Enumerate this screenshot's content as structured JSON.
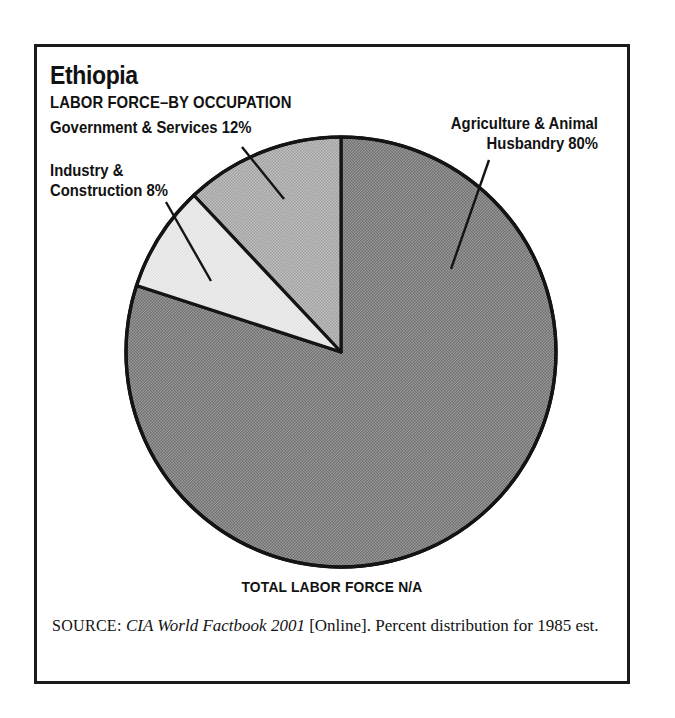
{
  "figure": {
    "country": "Ethiopia",
    "subtitle": "LABOR FORCE–BY OCCUPATION",
    "total_caption": "TOTAL LABOR FORCE N/A",
    "source": {
      "label": "SOURCE:",
      "title": "CIA World Factbook 2001",
      "rest": " [Online]. Percent distribution for 1985 est."
    }
  },
  "callouts": {
    "government": "Government & Services 12%",
    "industry_line1": "Industry &",
    "industry_line2": "Construction 8%",
    "agriculture_line1": "Agriculture & Animal",
    "agriculture_line2": "Husbandry 80%"
  },
  "chart_data": {
    "type": "pie",
    "title": "Ethiopia LABOR FORCE–BY OCCUPATION",
    "subtitle": "TOTAL LABOR FORCE N/A",
    "categories": [
      "Agriculture & Animal Husbandry",
      "Government & Services",
      "Industry & Construction"
    ],
    "values": [
      80,
      12,
      8
    ],
    "unit": "percent",
    "labels": [
      "Agriculture & Animal Husbandry 80%",
      "Government & Services 12%",
      "Industry & Construction 8%"
    ],
    "colors": [
      "#8b8b8b",
      "#b2b2b2",
      "#e9e9e9"
    ],
    "start_angle_deg": 0,
    "direction": "counterclockwise",
    "legend": "callout-labels",
    "grid": false,
    "note": "Percent distribution for 1985 est."
  },
  "geometry": {
    "center_x": 341,
    "center_y": 352,
    "radius": 215,
    "slices": [
      {
        "name": "government",
        "start_deg": 0,
        "sweep_deg": 43.2,
        "fill": "#b2b2b2"
      },
      {
        "name": "industry",
        "start_deg": 43.2,
        "sweep_deg": 28.8,
        "fill": "#e9e9e9"
      },
      {
        "name": "agriculture",
        "start_deg": 72.0,
        "sweep_deg": 288.0,
        "fill": "#8b8b8b"
      }
    ],
    "leaders": [
      {
        "name": "government",
        "x1": 242,
        "y1": 147,
        "x2": 284,
        "y2": 199
      },
      {
        "name": "industry",
        "x1": 166,
        "y1": 202,
        "x2": 211,
        "y2": 281
      },
      {
        "name": "agriculture",
        "x1": 489,
        "y1": 160,
        "x2": 451,
        "y2": 269
      }
    ]
  }
}
